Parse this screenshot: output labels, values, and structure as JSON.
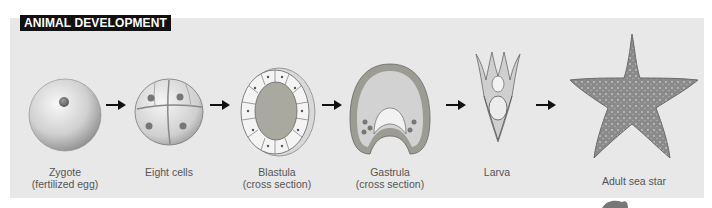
{
  "header": {
    "title": "ANIMAL DEVELOPMENT"
  },
  "stages": [
    {
      "id": "zygote",
      "line1": "Zygote",
      "line2": "(fertilized egg)"
    },
    {
      "id": "eight-cells",
      "line1": "Eight cells",
      "line2": ""
    },
    {
      "id": "blastula",
      "line1": "Blastula",
      "line2": "(cross section)"
    },
    {
      "id": "gastrula",
      "line1": "Gastrula",
      "line2": "(cross section)"
    },
    {
      "id": "larva",
      "line1": "Larva",
      "line2": ""
    },
    {
      "id": "adult",
      "line1": "Adult sea star",
      "line2": ""
    }
  ],
  "colors": {
    "panel": "#e8e8e8",
    "title_bg": "#111111",
    "title_text": "#ffffff",
    "label_text": "#555555",
    "sea_star": "#8a8a8a"
  }
}
